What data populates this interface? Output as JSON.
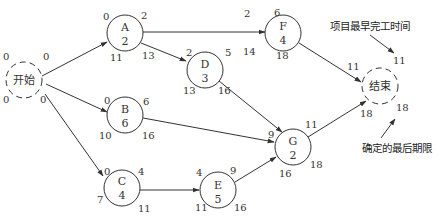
{
  "diagram": {
    "type": "activity-on-node network",
    "nodes": [
      {
        "id": "start",
        "label": "开始",
        "duration": "",
        "es": "0",
        "ef": "0",
        "ls": "0",
        "lf": "0",
        "dashed": true
      },
      {
        "id": "A",
        "label": "A",
        "duration": "2",
        "es": "0",
        "ef": "2",
        "ls": "11",
        "lf": "13"
      },
      {
        "id": "B",
        "label": "B",
        "duration": "6",
        "es": "0",
        "ef": "6",
        "ls": "10",
        "lf": "16"
      },
      {
        "id": "C",
        "label": "C",
        "duration": "4",
        "es": "0",
        "ef": "4",
        "ls": "7",
        "lf": "11"
      },
      {
        "id": "D",
        "label": "D",
        "duration": "3",
        "es": "2",
        "ef": "5",
        "ls": "13",
        "lf": "16"
      },
      {
        "id": "E",
        "label": "E",
        "duration": "5",
        "es": "4",
        "ef": "9",
        "ls": "11",
        "lf": "16"
      },
      {
        "id": "F",
        "label": "F",
        "duration": "4",
        "es": "2",
        "ef": "6",
        "ls": "14",
        "lf": "18"
      },
      {
        "id": "G",
        "label": "G",
        "duration": "2",
        "es": "9",
        "ef": "11",
        "ls": "16",
        "lf": "18"
      },
      {
        "id": "end",
        "label": "结束",
        "duration": "",
        "es": "11",
        "ef": "11",
        "ls": "18",
        "lf": "18",
        "dashed": true
      }
    ],
    "edges": [
      {
        "from": "start",
        "to": "A"
      },
      {
        "from": "start",
        "to": "B"
      },
      {
        "from": "start",
        "to": "C"
      },
      {
        "from": "A",
        "to": "D"
      },
      {
        "from": "A",
        "to": "F"
      },
      {
        "from": "B",
        "to": "G"
      },
      {
        "from": "C",
        "to": "E"
      },
      {
        "from": "D",
        "to": "G"
      },
      {
        "from": "E",
        "to": "G"
      },
      {
        "from": "F",
        "to": "end"
      },
      {
        "from": "G",
        "to": "end"
      }
    ],
    "annotations": {
      "earliest_finish": "项目最早完工时间",
      "deadline": "确定的最后期限"
    }
  }
}
